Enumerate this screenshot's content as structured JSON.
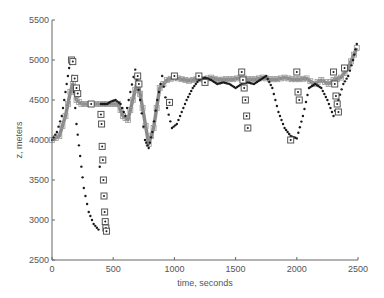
{
  "chart_data": {
    "type": "scatter",
    "title": "",
    "xlabel": "time, seconds",
    "ylabel": "z, meters",
    "xlim": [
      0,
      2500
    ],
    "ylim": [
      2500,
      5500
    ],
    "xticks": [
      0,
      500,
      1000,
      1500,
      2000,
      2500
    ],
    "yticks": [
      2500,
      3000,
      3500,
      4000,
      4500,
      5000,
      5500
    ],
    "grid": false,
    "legend": null,
    "colors": {
      "axis": "#666666",
      "dots": "#1a1a1a",
      "line": "#8a8a8a",
      "squares": "#555555"
    },
    "series": [
      {
        "name": "track-dots",
        "style": "black dots",
        "x": [
          0,
          40,
          80,
          110,
          140,
          160,
          180,
          200,
          230,
          260,
          300,
          340,
          380,
          400,
          420,
          450,
          480,
          520,
          560,
          600,
          640,
          680,
          720,
          760,
          790,
          820,
          860,
          900,
          940,
          980,
          1020,
          1060,
          1100,
          1150,
          1200,
          1250,
          1300,
          1350,
          1400,
          1450,
          1500,
          1550,
          1600,
          1650,
          1700,
          1750,
          1800,
          1850,
          1900,
          1950,
          2000,
          2050,
          2100,
          2150,
          2200,
          2250,
          2300,
          2340,
          2380,
          2420,
          2460,
          2490
        ],
        "y": [
          4000,
          4100,
          4300,
          4600,
          4900,
          5000,
          4600,
          4200,
          3800,
          3400,
          3100,
          2950,
          2880,
          4450,
          4450,
          4450,
          4480,
          4500,
          4450,
          4300,
          4600,
          4880,
          4500,
          4000,
          3900,
          4100,
          4500,
          4800,
          4400,
          4150,
          4200,
          4350,
          4500,
          4650,
          4750,
          4780,
          4750,
          4700,
          4720,
          4700,
          4650,
          4700,
          4720,
          4700,
          4750,
          4800,
          4650,
          4350,
          4150,
          4050,
          4020,
          4300,
          4650,
          4700,
          4650,
          4500,
          4300,
          4500,
          4700,
          4800,
          5000,
          5200
        ]
      },
      {
        "name": "track-line",
        "style": "gray thick line",
        "x": [
          0,
          60,
          110,
          150,
          170,
          200,
          240,
          300,
          360,
          420,
          480,
          540,
          580,
          620,
          660,
          700,
          740,
          790,
          830,
          880,
          940,
          1000,
          1060,
          1120,
          1180,
          1240,
          1300,
          1360,
          1420,
          1480,
          1540,
          1600,
          1660,
          1720,
          1780,
          1840,
          1900,
          1960,
          2020,
          2080,
          2140,
          2200,
          2260,
          2300,
          2360,
          2420,
          2490
        ],
        "y": [
          4000,
          4050,
          4300,
          4600,
          4700,
          4500,
          4450,
          4450,
          4450,
          4450,
          4450,
          4450,
          4300,
          4250,
          4500,
          4750,
          4400,
          3950,
          4150,
          4650,
          4750,
          4780,
          4760,
          4740,
          4760,
          4760,
          4780,
          4750,
          4760,
          4760,
          4780,
          4760,
          4760,
          4780,
          4760,
          4760,
          4780,
          4760,
          4760,
          4770,
          4700,
          4750,
          4700,
          4750,
          4780,
          4900,
          5150
        ]
      },
      {
        "name": "measurement-squares",
        "style": "open squares",
        "x": [
          160,
          170,
          185,
          200,
          210,
          320,
          400,
          405,
          410,
          415,
          420,
          425,
          430,
          435,
          440,
          445,
          700,
          710,
          960,
          1000,
          1200,
          1250,
          1550,
          1560,
          1570,
          1580,
          1590,
          1600,
          1950,
          2000,
          2010,
          2020,
          2300,
          2310,
          2320,
          2330,
          2340,
          2390
        ],
        "y": [
          5000,
          4980,
          4770,
          4650,
          4580,
          4450,
          4320,
          4200,
          3920,
          3750,
          3500,
          3300,
          3100,
          2980,
          2900,
          2860,
          4800,
          4700,
          4470,
          4800,
          4800,
          4720,
          4850,
          4750,
          4650,
          4500,
          4300,
          4150,
          4000,
          4850,
          4600,
          4500,
          4850,
          4700,
          4550,
          4450,
          4350,
          4900
        ]
      }
    ]
  }
}
